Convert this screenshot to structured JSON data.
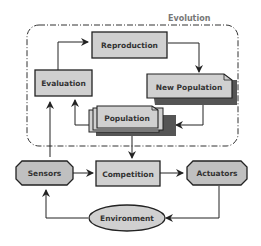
{
  "diagram": {
    "group_title": "Evolution",
    "nodes": {
      "reproduction": "Reproduction",
      "evaluation": "Evaluation",
      "new_population": "New Population",
      "population": "Population",
      "sensors": "Sensors",
      "competition": "Competition",
      "actuators": "Actuators",
      "environment": "Environment"
    },
    "colors": {
      "fill": "#d0d0d0",
      "stroke": "#222222",
      "shadow": "#555555",
      "group_border": "#333333",
      "title": "#777777"
    }
  }
}
